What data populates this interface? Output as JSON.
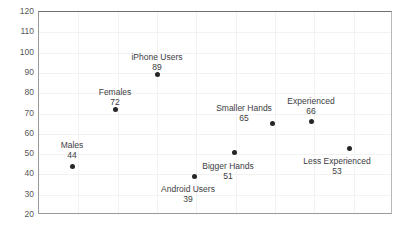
{
  "chart_data": {
    "type": "scatter",
    "title": "",
    "xlabel": "",
    "ylabel": "",
    "ylim": [
      20,
      120
    ],
    "ytick_step": 10,
    "ytick_labels": [
      "120",
      "110",
      "100",
      "90",
      "80",
      "70",
      "60",
      "50",
      "40",
      "30",
      "20"
    ],
    "grid": true,
    "legend": "none",
    "marker_color": "#262626",
    "gridline_color": "#f2f2f2",
    "axis_color": "#9a9a9a",
    "label_color": "#3d3d3f",
    "points": [
      {
        "name": "Males",
        "value": 44,
        "px": 71,
        "label_position": "above",
        "label_px": 71,
        "label_py": 139
      },
      {
        "name": "Females",
        "value": 72,
        "px": 114,
        "label_position": "above",
        "label_py": 86
      },
      {
        "name": "iPhone Users",
        "value": 89,
        "px": 156,
        "label_position": "above",
        "label_py": 51
      },
      {
        "name": "Android Users",
        "value": 39,
        "px": 193,
        "label_position": "below",
        "label_py": 183
      },
      {
        "name": "Bigger Hands",
        "value": 51,
        "px": 233,
        "label_position": "below",
        "label_py": 160
      },
      {
        "name": "Smaller Hands",
        "value": 65,
        "px": 271,
        "label_position": "above-left",
        "label_py": 102
      },
      {
        "name": "Experienced",
        "value": 66,
        "px": 310,
        "label_position": "above",
        "label_py": 95
      },
      {
        "name": "Less Experienced",
        "value": 53,
        "px": 348,
        "label_position": "below",
        "label_py": 155
      }
    ],
    "vertical_gridlines_count": 8
  }
}
